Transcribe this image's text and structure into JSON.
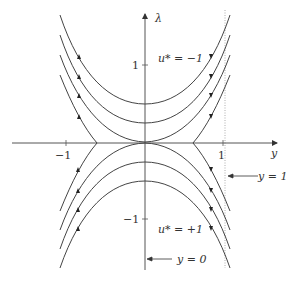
{
  "diagram": {
    "type": "phase-portrait",
    "axes": {
      "horizontal": {
        "label": "y",
        "ticks": [
          {
            "value": -1,
            "label": "−1"
          },
          {
            "value": 1,
            "label": "1"
          }
        ]
      },
      "vertical": {
        "label": "λ",
        "ticks": [
          {
            "value": 1,
            "label": "1"
          },
          {
            "value": -1,
            "label": "−1"
          }
        ]
      }
    },
    "annotations": {
      "upper_region": "u* = −1",
      "lower_region": "u* = +1",
      "line_y1": "y = 1",
      "line_y0": "y = 0"
    },
    "colors": {
      "curve": "#444444",
      "axis": "#555555",
      "dotted": "#999999"
    }
  }
}
